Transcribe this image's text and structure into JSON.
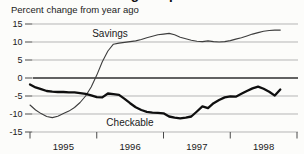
{
  "title_clipped": "Savings Deposits",
  "subtitle": "Percent change from year ago",
  "chart_data": {
    "type": "line",
    "subtitle": "Percent change from year ago",
    "x_unit": "month",
    "x_range": "Jan 1995 - Oct 1998",
    "x_tick_years": [
      "1995",
      "1996",
      "1997",
      "1998"
    ],
    "y_ticks": [
      15,
      10,
      5,
      0,
      -5,
      -10,
      -15
    ],
    "ylim": [
      -15,
      15
    ],
    "grid": "horizontal-light, zero line emphasized",
    "legend_position": "inline labels on plot",
    "series": [
      {
        "name": "Savings",
        "color": "#3d3d3d",
        "width": 1.1,
        "values": [
          -7.5,
          -8.9,
          -9.9,
          -10.7,
          -11.0,
          -10.6,
          -9.9,
          -9.2,
          -8.2,
          -6.8,
          -5.0,
          -2.5,
          0.8,
          4.5,
          7.5,
          9.4,
          9.7,
          9.9,
          10.1,
          10.3,
          10.7,
          11.2,
          11.6,
          12.0,
          12.2,
          12.4,
          12.0,
          11.3,
          10.9,
          10.5,
          10.2,
          10.1,
          10.3,
          10.1,
          10.0,
          10.1,
          10.4,
          10.8,
          11.2,
          11.7,
          12.2,
          12.6,
          13.0,
          13.2,
          13.3,
          13.3
        ]
      },
      {
        "name": "Checkable",
        "color": "#0f0f0f",
        "width": 2.3,
        "values": [
          -1.8,
          -2.6,
          -3.1,
          -3.6,
          -3.8,
          -3.9,
          -3.9,
          -4.0,
          -4.0,
          -4.2,
          -4.4,
          -4.8,
          -5.3,
          -5.4,
          -4.3,
          -4.5,
          -4.7,
          -5.8,
          -7.0,
          -8.1,
          -8.9,
          -9.4,
          -9.6,
          -9.7,
          -9.8,
          -10.7,
          -11.0,
          -11.2,
          -11.0,
          -10.7,
          -9.3,
          -7.9,
          -8.4,
          -7.0,
          -6.1,
          -5.4,
          -5.1,
          -5.2,
          -4.4,
          -3.6,
          -2.9,
          -2.4,
          -3.0,
          -3.8,
          -4.9,
          -3.2
        ]
      }
    ],
    "colors": {
      "background": "#fcfcfa",
      "grid": "#b5b5b5",
      "zero_line": "#2f2f2f",
      "tick": "#4a4a4a",
      "text": "#1a1a1a"
    }
  }
}
